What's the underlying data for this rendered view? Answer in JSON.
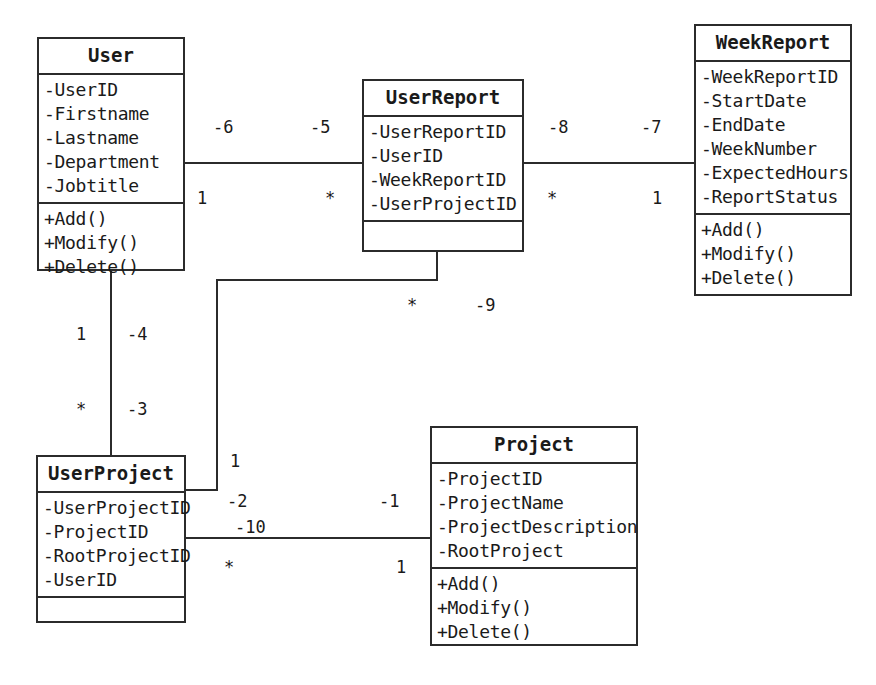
{
  "diagram": {
    "type": "uml-class-diagram",
    "title": "",
    "classes": [
      {
        "id": "user",
        "name": "User",
        "attributes": [
          "-UserID",
          "-Firstname",
          "-Lastname",
          "-Department",
          "-Jobtitle"
        ],
        "operations": [
          "+Add()",
          "+Modify()",
          "+Delete()"
        ]
      },
      {
        "id": "userreport",
        "name": "UserReport",
        "attributes": [
          "-UserReportID",
          "-UserID",
          "-WeekReportID",
          "-UserProjectID"
        ],
        "operations": []
      },
      {
        "id": "weekreport",
        "name": "WeekReport",
        "attributes": [
          "-WeekReportID",
          "-StartDate",
          "-EndDate",
          "-WeekNumber",
          "-ExpectedHours",
          "-ReportStatus"
        ],
        "operations": [
          "+Add()",
          "+Modify()",
          "+Delete()"
        ]
      },
      {
        "id": "userproject",
        "name": "UserProject",
        "attributes": [
          "-UserProjectID",
          "-ProjectID",
          "-RootProjectID",
          "-UserID"
        ],
        "operations": []
      },
      {
        "id": "project",
        "name": "Project",
        "attributes": [
          "-ProjectID",
          "-ProjectName",
          "-ProjectDescription",
          "-RootProject"
        ],
        "operations": [
          "+Add()",
          "+Modify()",
          "+Delete()"
        ]
      }
    ],
    "associations": [
      {
        "id": "user-userreport",
        "from": "User",
        "to": "UserReport",
        "source_role": "-6",
        "target_role": "-5",
        "source_multiplicity": "1",
        "target_multiplicity": "*"
      },
      {
        "id": "userreport-weekreport",
        "from": "UserReport",
        "to": "WeekReport",
        "source_role": "-8",
        "target_role": "-7",
        "source_multiplicity": "*",
        "target_multiplicity": "1"
      },
      {
        "id": "userreport-userproject",
        "from": "UserReport",
        "to": "UserProject",
        "source_role": "-9",
        "target_role": "-2",
        "source_multiplicity": "*",
        "target_multiplicity": "1"
      },
      {
        "id": "user-userproject",
        "from": "User",
        "to": "UserProject",
        "source_role": "-4",
        "target_role": "-3",
        "source_multiplicity": "1",
        "target_multiplicity": "*"
      },
      {
        "id": "userproject-project",
        "from": "UserProject",
        "to": "Project",
        "source_role": "-10",
        "target_role": "-1",
        "source_multiplicity": "*",
        "target_multiplicity": "1"
      }
    ],
    "labels": {
      "l_minus6": "-6",
      "l_minus5": "-5",
      "l_minus8": "-8",
      "l_minus7": "-7",
      "l_one_a": "1",
      "l_star_a": "*",
      "l_star_b": "*",
      "l_one_b": "1",
      "l_star_c": "*",
      "l_minus9": "-9",
      "l_one_c": "1",
      "l_minus4": "-4",
      "l_star_d": "*",
      "l_minus3": "-3",
      "l_one_d": "1",
      "l_minus2": "-2",
      "l_minus10": "-10",
      "l_minus1": "-1",
      "l_star_e": "*",
      "l_one_e": "1"
    }
  }
}
